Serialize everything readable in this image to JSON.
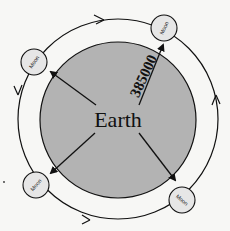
{
  "diagram": {
    "earth_label": "Earth",
    "distance_label": "385000",
    "moons": [
      {
        "label": "Moon",
        "position": "top-left"
      },
      {
        "label": "Moon",
        "position": "top-right"
      },
      {
        "label": "Moon",
        "position": "bottom-left"
      },
      {
        "label": "Moon",
        "position": "bottom-right"
      }
    ],
    "orbit_direction": "counter-clockwise",
    "colors": {
      "earth_fill": "#b3b3b3",
      "moon_fill": "#e6e6e6",
      "line": "#111111",
      "background": "#f7f7f5"
    }
  }
}
